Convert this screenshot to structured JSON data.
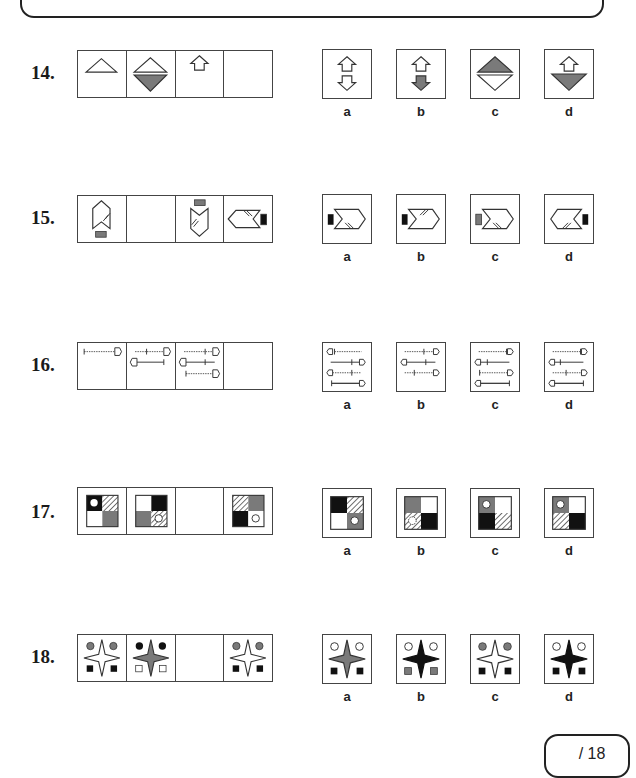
{
  "score": {
    "text": "/ 18"
  },
  "questions": [
    {
      "number": "14.",
      "options": [
        "a",
        "b",
        "c",
        "d"
      ]
    },
    {
      "number": "15.",
      "options": [
        "a",
        "b",
        "c",
        "d"
      ]
    },
    {
      "number": "16.",
      "options": [
        "a",
        "b",
        "c",
        "d"
      ]
    },
    {
      "number": "17.",
      "options": [
        "a",
        "b",
        "c",
        "d"
      ]
    },
    {
      "number": "18.",
      "options": [
        "a",
        "b",
        "c",
        "d"
      ]
    }
  ],
  "colors": {
    "gray_fill": "#7a7a7a",
    "black_fill": "#111111",
    "stroke": "#333333"
  }
}
